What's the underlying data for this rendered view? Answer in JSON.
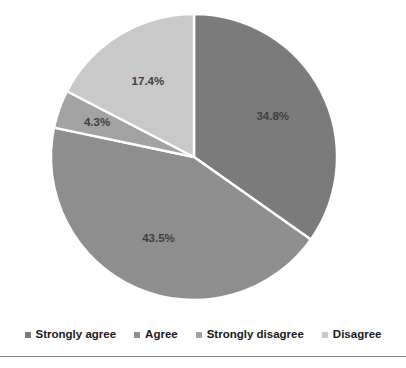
{
  "chart_data": {
    "type": "pie",
    "title": "",
    "categories": [
      "Strongly agree",
      "Agree",
      "Strongly disagree",
      "Disagree"
    ],
    "values": [
      34.8,
      43.5,
      4.3,
      17.4
    ],
    "labels": [
      "34.8%",
      "43.5%",
      "4.3%",
      "17.4%"
    ],
    "unit": "%",
    "start_angle_deg": 0,
    "direction": "clockwise",
    "legend_position": "bottom",
    "grid": false,
    "colors": [
      "#7b7b7b",
      "#8e8e8e",
      "#a3a3a3",
      "#c9c9c9"
    ],
    "separator_color": "#ffffff",
    "slices": [
      {
        "name": "Strongly agree",
        "value": 34.8,
        "label": "34.8%",
        "color": "#7b7b7b"
      },
      {
        "name": "Agree",
        "value": 43.5,
        "label": "43.5%",
        "color": "#8e8e8e"
      },
      {
        "name": "Strongly disagree",
        "value": 4.3,
        "label": "4.3%",
        "color": "#a3a3a3"
      },
      {
        "name": "Disagree",
        "value": 17.4,
        "label": "17.4%",
        "color": "#c9c9c9"
      }
    ]
  },
  "legend": {
    "items": [
      {
        "label": "Strongly agree",
        "color": "#7b7b7b"
      },
      {
        "label": "Agree",
        "color": "#8e8e8e"
      },
      {
        "label": "Strongly disagree",
        "color": "#a3a3a3"
      },
      {
        "label": "Disagree",
        "color": "#c9c9c9"
      }
    ]
  },
  "geometry": {
    "center_x": 194,
    "center_y": 157,
    "radius": 143
  }
}
